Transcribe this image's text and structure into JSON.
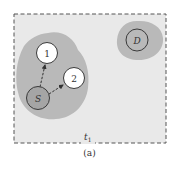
{
  "figure": {
    "caption": "(a)",
    "time_label": "t",
    "time_subscript": "1",
    "colors": {
      "frame_fill": "#e9e9e9",
      "frame_border": "#555555",
      "region_fill": "#b9b9b9",
      "node_fill": "#ffffff",
      "source_fill": "#a5a5a5",
      "node_stroke": "#3a3a3a",
      "arrow": "#333333"
    },
    "nodes": [
      {
        "id": "S",
        "label": "S",
        "role": "source"
      },
      {
        "id": "1",
        "label": "1",
        "role": "neighbor"
      },
      {
        "id": "2",
        "label": "2",
        "role": "neighbor"
      },
      {
        "id": "D",
        "label": "D",
        "role": "destination"
      }
    ],
    "edges": [
      {
        "from": "S",
        "to": "1",
        "style": "dashed-arrow"
      },
      {
        "from": "S",
        "to": "2",
        "style": "dashed-arrow"
      }
    ]
  }
}
